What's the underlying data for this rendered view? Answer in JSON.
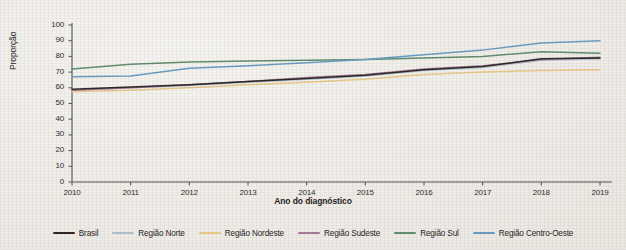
{
  "chart_data": {
    "type": "line",
    "title": "",
    "xlabel": "Ano do diagnóstico",
    "ylabel": "Proporção",
    "x": [
      2010,
      2011,
      2012,
      2013,
      2014,
      2015,
      2016,
      2017,
      2018,
      2019
    ],
    "xticklabels": [
      "2010",
      "2011",
      "2012",
      "2013",
      "2014",
      "2015",
      "2016",
      "2017",
      "2018",
      "2019"
    ],
    "yticklabels": [
      "0",
      "10",
      "20",
      "30",
      "40",
      "50",
      "60",
      "70",
      "80",
      "90",
      "100"
    ],
    "ylim": [
      0,
      100
    ],
    "ytick_step": 10,
    "grid": false,
    "legend_position": "bottom",
    "series": [
      {
        "name": "Brasil",
        "color": "#2f2a28",
        "values": [
          59.0,
          60.5,
          62.0,
          64.0,
          66.0,
          68.0,
          71.5,
          73.5,
          78.5,
          79.0
        ]
      },
      {
        "name": "Região Norte",
        "color": "#aebfcc",
        "values": [
          58.5,
          60.0,
          61.5,
          63.5,
          65.5,
          67.5,
          71.0,
          73.0,
          77.5,
          78.5
        ]
      },
      {
        "name": "Região Nordeste",
        "color": "#e9c98a",
        "values": [
          57.5,
          58.5,
          60.0,
          62.0,
          63.5,
          65.5,
          68.5,
          70.0,
          71.0,
          71.5
        ]
      },
      {
        "name": "Região Sudeste",
        "color": "#a87b9a",
        "values": [
          58.5,
          60.0,
          62.0,
          64.0,
          66.5,
          68.5,
          72.0,
          74.0,
          78.0,
          79.5
        ]
      },
      {
        "name": "Região Sul",
        "color": "#5f8f6e",
        "values": [
          72.0,
          75.0,
          76.5,
          77.0,
          77.5,
          78.0,
          79.0,
          80.0,
          83.0,
          82.0
        ]
      },
      {
        "name": "Região Centro-Oeste",
        "color": "#6b9dc4",
        "values": [
          67.0,
          67.5,
          72.5,
          74.0,
          76.0,
          78.0,
          81.0,
          84.0,
          88.5,
          90.0
        ]
      }
    ]
  }
}
